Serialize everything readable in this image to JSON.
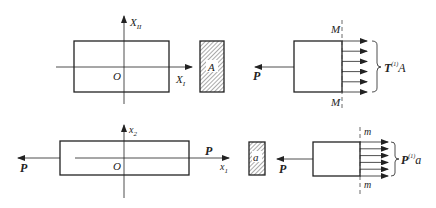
{
  "top": {
    "axis_vertical_label": "X",
    "axis_vertical_sub": "II",
    "axis_horizontal_label": "X",
    "axis_horizontal_sub": "I",
    "origin_label": "O",
    "section_label": "A",
    "force_label": "P",
    "cut_label_top": "M",
    "cut_label_bottom": "M",
    "resultant_main": "T",
    "resultant_sup": "(1)",
    "resultant_tail": "A"
  },
  "bottom": {
    "axis_vertical_label": "x",
    "axis_vertical_sub": "2",
    "axis_horizontal_label": "x",
    "axis_horizontal_sub": "1",
    "origin_label": "O",
    "force_left_label": "P",
    "force_right_label": "P",
    "section_label": "a",
    "force_label": "P",
    "cut_label_top": "m",
    "cut_label_bottom": "m",
    "resultant_main": "P",
    "resultant_sup": "(1)",
    "resultant_tail": "a"
  },
  "colors": {
    "stroke": "#222222",
    "hatch": "#555555",
    "background": "#ffffff"
  }
}
